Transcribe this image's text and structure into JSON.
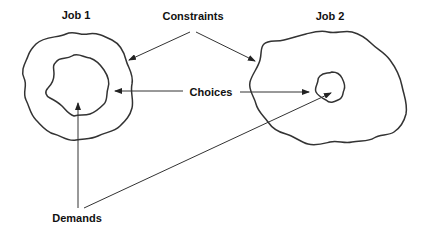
{
  "diagram": {
    "labels": {
      "job1": "Job 1",
      "job2": "Job 2",
      "constraints": "Constraints",
      "choices": "Choices",
      "demands": "Demands"
    },
    "nodes": [
      {
        "id": "job1-constraints",
        "shape": "wavy-blob",
        "job": "Job 1",
        "role": "outer boundary (constraints)"
      },
      {
        "id": "job1-demands",
        "shape": "wavy-blob",
        "job": "Job 1",
        "role": "inner core (demands)"
      },
      {
        "id": "job2-constraints",
        "shape": "wavy-blob",
        "job": "Job 2",
        "role": "outer boundary (constraints)"
      },
      {
        "id": "job2-demands",
        "shape": "wavy-blob",
        "job": "Job 2",
        "role": "inner core (demands)"
      }
    ],
    "edges": [
      {
        "from": "Constraints",
        "to": "job1-constraints"
      },
      {
        "from": "Constraints",
        "to": "job2-constraints"
      },
      {
        "from": "Choices",
        "to": "job1-demands"
      },
      {
        "from": "Choices",
        "to": "job2-demands"
      },
      {
        "from": "Demands",
        "to": "job1-demands"
      },
      {
        "from": "Demands",
        "to": "job2-demands"
      }
    ],
    "colors": {
      "stroke": "#333333",
      "text": "#111111",
      "background": "#ffffff"
    }
  }
}
